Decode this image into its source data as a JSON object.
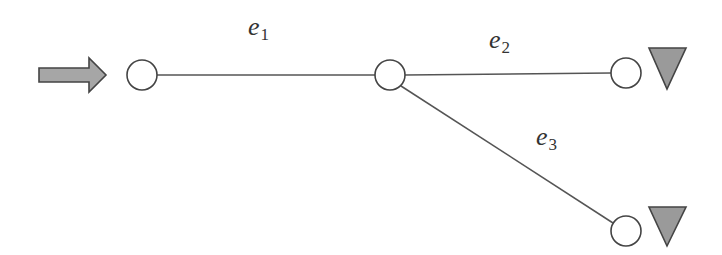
{
  "diagram": {
    "type": "network-graph",
    "colors": {
      "edge": "#555555",
      "node_stroke": "#444444",
      "node_fill": "#ffffff",
      "sink_fill": "#9a9a9a",
      "source_fill": "#a6a6a6"
    },
    "source": {
      "label": "inflow-arrow",
      "x1": 38,
      "x2": 106,
      "cy": 75
    },
    "nodes": [
      {
        "id": "n1",
        "cx": 142,
        "cy": 75,
        "r": 15
      },
      {
        "id": "n2",
        "cx": 390,
        "cy": 75,
        "r": 15
      },
      {
        "id": "n3",
        "cx": 626,
        "cy": 73,
        "r": 15
      },
      {
        "id": "n4",
        "cx": 626,
        "cy": 231,
        "r": 15
      }
    ],
    "edges": [
      {
        "id": "e1",
        "from": "n1",
        "to": "n2",
        "symbol": "e",
        "index": "1"
      },
      {
        "id": "e2",
        "from": "n2",
        "to": "n3",
        "symbol": "e",
        "index": "2"
      },
      {
        "id": "e3",
        "from": "n2",
        "to": "n4",
        "symbol": "e",
        "index": "3"
      }
    ],
    "sinks": [
      {
        "id": "sink-n3",
        "attached_to": "n3"
      },
      {
        "id": "sink-n4",
        "attached_to": "n4"
      }
    ]
  }
}
